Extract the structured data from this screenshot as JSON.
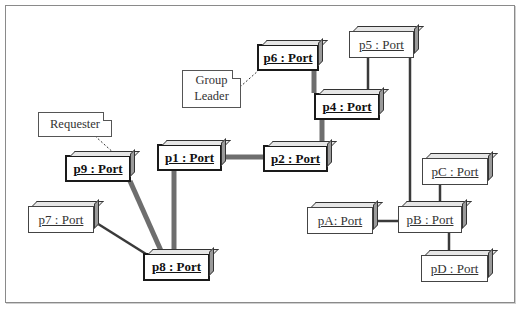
{
  "diagram": {
    "type": "uml-object-diagram",
    "nodes": [
      {
        "id": "p1",
        "label": "p1 : Port",
        "style": "bold"
      },
      {
        "id": "p2",
        "label": "p2 : Port",
        "style": "bold"
      },
      {
        "id": "p4",
        "label": "p4 : Port",
        "style": "bold"
      },
      {
        "id": "p5",
        "label": "p5 : Port",
        "style": "light"
      },
      {
        "id": "p6",
        "label": "p6 : Port",
        "style": "bold"
      },
      {
        "id": "p7",
        "label": "p7 : Port",
        "style": "light"
      },
      {
        "id": "p8",
        "label": "p8 : Port",
        "style": "bold"
      },
      {
        "id": "p9",
        "label": "p9 : Port",
        "style": "bold"
      },
      {
        "id": "pA",
        "label": "pA: Port",
        "style": "light"
      },
      {
        "id": "pB",
        "label": "pB : Port",
        "style": "light"
      },
      {
        "id": "pC",
        "label": "pC : Port",
        "style": "light"
      },
      {
        "id": "pD",
        "label": "pD : Port",
        "style": "light"
      }
    ],
    "notes": [
      {
        "id": "group_leader",
        "text_line1": "Group",
        "text_line2": "Leader",
        "attached_to": "p6"
      },
      {
        "id": "requester",
        "text": "Requester",
        "attached_to": "p9"
      }
    ],
    "links": [
      {
        "from": "p6",
        "to": "p4",
        "weight": "thick"
      },
      {
        "from": "p4",
        "to": "p2",
        "weight": "thick"
      },
      {
        "from": "p2",
        "to": "p1",
        "weight": "thick"
      },
      {
        "from": "p1",
        "to": "p8",
        "weight": "thick"
      },
      {
        "from": "p9",
        "to": "p8",
        "weight": "thick"
      },
      {
        "from": "p7",
        "to": "p8",
        "weight": "thin"
      },
      {
        "from": "p5",
        "to": "p4",
        "weight": "thin"
      },
      {
        "from": "p5",
        "to": "pB",
        "weight": "thin"
      },
      {
        "from": "pA",
        "to": "pB",
        "weight": "thin"
      },
      {
        "from": "pC",
        "to": "pB",
        "weight": "thin"
      },
      {
        "from": "pB",
        "to": "pD",
        "weight": "thin"
      }
    ],
    "colors": {
      "thick_link": "#6e6e6e",
      "thin_link": "#3a3a3a",
      "border": "#1a1a1a"
    }
  }
}
